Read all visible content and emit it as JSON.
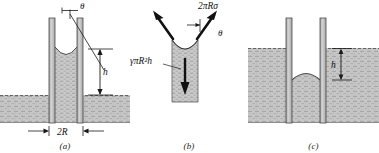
{
  "figure": {
    "panels": [
      {
        "id": "a",
        "caption": "(a)",
        "description": "Capillary rise of a wetting liquid in a tube",
        "labels": {
          "contact_angle": "θ",
          "rise_height": "h",
          "diameter": "2R"
        }
      },
      {
        "id": "b",
        "caption": "(b)",
        "description": "Free-body diagram of the raised liquid column",
        "labels": {
          "surface_tension_force": "2πRσ",
          "weight_force": "γπR²h",
          "contact_angle": "θ"
        }
      },
      {
        "id": "c",
        "caption": "(c)",
        "description": "Capillary depression of a non-wetting liquid",
        "labels": {
          "depression_height": "h"
        }
      }
    ]
  },
  "colors": {
    "fluid": "#c9c9c9",
    "fluid_dark": "#b8b8b8",
    "tube_wall": "#b3b3b3",
    "tube_edge": "#555555",
    "ground": "#c4c4c4",
    "line": "#1a1a1a",
    "background": "#ffffff"
  }
}
